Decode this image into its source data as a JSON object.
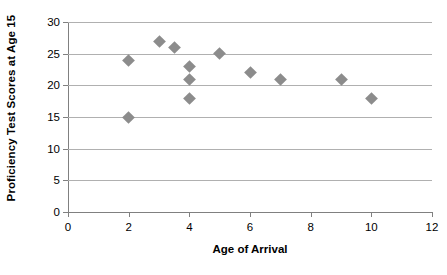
{
  "chart_data": {
    "type": "scatter",
    "title": "",
    "xlabel": "Age of Arrival",
    "ylabel": "Proficiency Test Scores at Age 15",
    "xlim": [
      0,
      12
    ],
    "ylim": [
      0,
      30
    ],
    "xticks": [
      "0",
      "2",
      "4",
      "6",
      "8",
      "10",
      "12"
    ],
    "yticks": [
      "0",
      "5",
      "10",
      "15",
      "20",
      "25",
      "30"
    ],
    "xtick_values": [
      0,
      2,
      4,
      6,
      8,
      10,
      12
    ],
    "ytick_values": [
      0,
      5,
      10,
      15,
      20,
      25,
      30
    ],
    "grid": "horizontal",
    "legend": "none",
    "marker_shape": "diamond",
    "marker_color": "#8c8c8c",
    "gridline_color": "#b0b0b0",
    "axis_color": "#808080",
    "points": [
      {
        "x": 2,
        "y": 24
      },
      {
        "x": 2,
        "y": 15
      },
      {
        "x": 3,
        "y": 27
      },
      {
        "x": 3.5,
        "y": 26
      },
      {
        "x": 4,
        "y": 23
      },
      {
        "x": 4,
        "y": 21
      },
      {
        "x": 4,
        "y": 18
      },
      {
        "x": 5,
        "y": 25
      },
      {
        "x": 6,
        "y": 22
      },
      {
        "x": 7,
        "y": 21
      },
      {
        "x": 9,
        "y": 21
      },
      {
        "x": 10,
        "y": 18
      }
    ]
  }
}
